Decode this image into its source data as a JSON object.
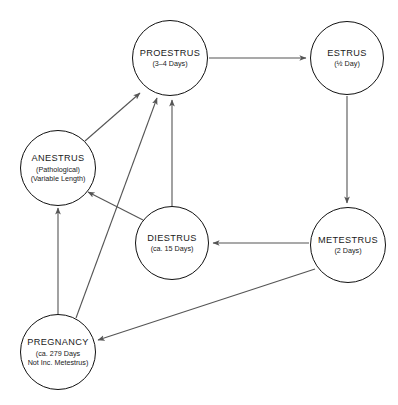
{
  "diagram": {
    "type": "cycle-flow-diagram",
    "background_color": "#ffffff",
    "node_border_color": "#111111",
    "edge_color": "#555555",
    "nodes": [
      {
        "id": "proestrus",
        "title": "PROESTRUS",
        "sub": "(3–4 Days)",
        "sub2": "",
        "cx": 170,
        "cy": 58,
        "r": 38
      },
      {
        "id": "estrus",
        "title": "ESTRUS",
        "sub": "(½ Day)",
        "sub2": "",
        "cx": 347,
        "cy": 58,
        "r": 37
      },
      {
        "id": "anestrus",
        "title": "ANESTRUS",
        "sub": "(Pathological)",
        "sub2": "(Variable Length)",
        "cx": 58,
        "cy": 168,
        "r": 38
      },
      {
        "id": "diestrus",
        "title": "DIESTRUS",
        "sub": "(ca. 15 Days)",
        "sub2": "",
        "cx": 172,
        "cy": 243,
        "r": 37
      },
      {
        "id": "metestrus",
        "title": "METESTRUS",
        "sub": "(2 Days)",
        "sub2": "",
        "cx": 348,
        "cy": 245,
        "r": 38
      },
      {
        "id": "pregnancy",
        "title": "PREGNANCY",
        "sub": "(ca. 279 Days",
        "sub2": "Not Inc. Metestrus)",
        "cx": 58,
        "cy": 352,
        "r": 38
      }
    ],
    "edges": [
      {
        "from": "proestrus",
        "to": "estrus",
        "label": ""
      },
      {
        "from": "estrus",
        "to": "metestrus",
        "label": ""
      },
      {
        "from": "metestrus",
        "to": "diestrus",
        "label": ""
      },
      {
        "from": "metestrus",
        "to": "pregnancy",
        "label": ""
      },
      {
        "from": "diestrus",
        "to": "proestrus",
        "label": ""
      },
      {
        "from": "diestrus",
        "to": "anestrus",
        "label": ""
      },
      {
        "from": "anestrus",
        "to": "proestrus",
        "label": ""
      },
      {
        "from": "pregnancy",
        "to": "proestrus",
        "label": ""
      },
      {
        "from": "pregnancy",
        "to": "anestrus",
        "label": ""
      }
    ]
  }
}
